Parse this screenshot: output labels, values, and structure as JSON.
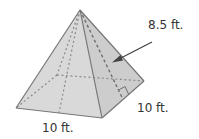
{
  "figure": {
    "type": "square-pyramid",
    "labels": {
      "slant_height": "8.5 ft.",
      "base_side_right": "10 ft.",
      "base_side_front": "10 ft."
    },
    "colors": {
      "face_fill": "#d9d9d9",
      "face_fill_right": "#cfcfcf",
      "edge": "#777777",
      "hidden_edge": "#8a8a8a",
      "arrow": "#444444",
      "text": "#333333"
    }
  }
}
